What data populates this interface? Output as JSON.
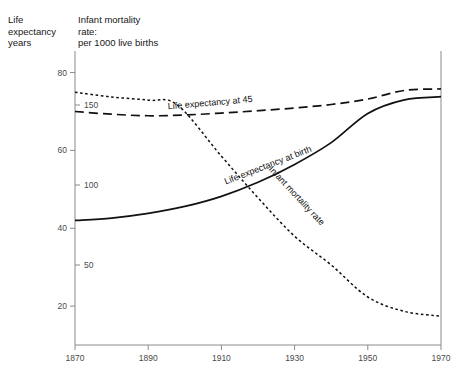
{
  "header": {
    "left_axis_title": "Life\nexpectancy\nyears",
    "right_axis_title": "Infant mortality\nrate:\nper 1000 live births"
  },
  "chart_data": {
    "type": "line",
    "title": "",
    "xlabel": "",
    "ylabel": "Life expectancy years",
    "y2label": "Infant mortality rate: per 1000 live births",
    "grid": false,
    "legend": "inline-labels",
    "xlim": [
      1870,
      1970
    ],
    "ylim": [
      10,
      84
    ],
    "y2lim": [
      0,
      180
    ],
    "xticks": [
      1870,
      1890,
      1910,
      1930,
      1950,
      1970
    ],
    "xticklabels": [
      "1870",
      "1890",
      "1910",
      "1930",
      "1950",
      "1970"
    ],
    "yticks": [
      20,
      40,
      60,
      80
    ],
    "yticklabels": [
      "20",
      "40",
      "60",
      "80"
    ],
    "y2ticks": [
      50,
      100,
      150
    ],
    "y2ticklabels": [
      "50",
      "100",
      "150"
    ],
    "series": [
      {
        "name": "Life expectancy at 45",
        "axis": "left",
        "style": "dashed",
        "label_x": 1907,
        "label_y": 71.5,
        "label_rotate": -5,
        "x": [
          1870,
          1880,
          1890,
          1900,
          1910,
          1920,
          1930,
          1940,
          1950,
          1960,
          1970
        ],
        "values": [
          70.0,
          69.3,
          68.9,
          69.1,
          69.6,
          70.2,
          70.9,
          71.8,
          73.2,
          75.4,
          75.8
        ]
      },
      {
        "name": "Life expectancy at birth",
        "axis": "left",
        "style": "solid",
        "label_x": 1923,
        "label_y": 55.5,
        "label_rotate": -21,
        "x": [
          1870,
          1880,
          1890,
          1900,
          1910,
          1920,
          1930,
          1940,
          1950,
          1960,
          1970
        ],
        "values": [
          42.0,
          42.6,
          43.8,
          45.6,
          48.2,
          51.8,
          56.4,
          62.0,
          69.5,
          73.0,
          73.8
        ]
      },
      {
        "name": "Infant mortality rate",
        "axis": "right",
        "style": "dotted",
        "label_x": 1930,
        "label_y_right": 92,
        "label_rotate": 47,
        "x": [
          1870,
          1880,
          1890,
          1898,
          1910,
          1920,
          1930,
          1940,
          1950,
          1960,
          1970
        ],
        "values": [
          158,
          155,
          153,
          150,
          118,
          92,
          68,
          50,
          30,
          21,
          18
        ]
      }
    ]
  }
}
